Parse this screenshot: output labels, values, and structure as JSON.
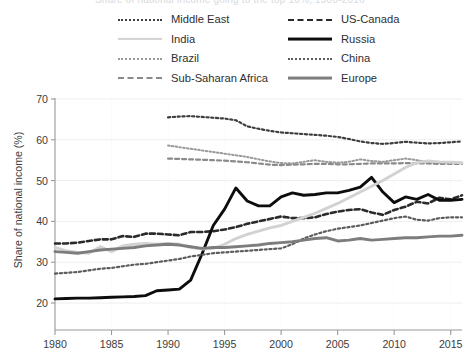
{
  "title_clipped": "Share of national income going to the top 10%, 1980-2016",
  "legend": {
    "columns": [
      {
        "items": [
          {
            "label": "Middle East",
            "key": "middle-east",
            "style": "dotted",
            "color": "#3d3d3d"
          },
          {
            "label": "India",
            "key": "india",
            "style": "solid",
            "color": "#d2d2d2"
          },
          {
            "label": "Brazil",
            "key": "brazil",
            "style": "dotted-fine",
            "color": "#9a9a9a"
          },
          {
            "label": "Sub-Saharan Africa",
            "key": "sub-saharan-africa",
            "style": "dashed",
            "color": "#8a8a8a"
          }
        ]
      },
      {
        "items": [
          {
            "label": "US-Canada",
            "key": "us-canada",
            "style": "dashed-bold",
            "color": "#2a2a2a"
          },
          {
            "label": "Russia",
            "key": "russia",
            "style": "solid-bold",
            "color": "#0d0d0d"
          },
          {
            "label": "China",
            "key": "china",
            "style": "dotted",
            "color": "#5c5c5c"
          },
          {
            "label": "Europe",
            "key": "europe",
            "style": "solid-bold",
            "color": "#7d7d7d"
          }
        ]
      }
    ]
  },
  "chart_data": {
    "type": "line",
    "title": "",
    "xlabel": "",
    "ylabel": "Share of national income (%)",
    "xlim": [
      1980,
      2016
    ],
    "ylim": [
      18,
      70
    ],
    "xticks": [
      1980,
      1985,
      1990,
      1995,
      2000,
      2005,
      2010,
      2015
    ],
    "yticks": [
      20,
      30,
      40,
      50,
      60,
      70
    ],
    "grid": true,
    "legend_position": "top",
    "series": [
      {
        "name": "Middle East",
        "color": "#3d3d3d",
        "style": "dotted",
        "width": 2.2,
        "x": [
          1990,
          1991,
          1992,
          1993,
          1994,
          1995,
          1996,
          1997,
          1998,
          1999,
          2000,
          2001,
          2002,
          2003,
          2004,
          2005,
          2006,
          2007,
          2008,
          2009,
          2010,
          2011,
          2012,
          2013,
          2014,
          2015,
          2016
        ],
        "y": [
          65.5,
          65.7,
          65.8,
          65.6,
          65.4,
          65.2,
          64.8,
          63.3,
          62.7,
          62.2,
          61.8,
          61.6,
          61.4,
          61.2,
          61.0,
          60.7,
          60.2,
          59.6,
          59.2,
          59.0,
          59.2,
          59.5,
          59.3,
          59.1,
          59.2,
          59.4,
          59.6
        ]
      },
      {
        "name": "Brazil",
        "color": "#9a9a9a",
        "style": "dotted-fine",
        "width": 2.0,
        "x": [
          1990,
          1991,
          1992,
          1993,
          1994,
          1995,
          1996,
          1997,
          1998,
          1999,
          2000,
          2001,
          2002,
          2003,
          2004,
          2005,
          2006,
          2007,
          2008,
          2009,
          2010,
          2011,
          2012,
          2013,
          2014,
          2015,
          2016
        ],
        "y": [
          58.6,
          58.2,
          57.8,
          57.4,
          57.0,
          56.6,
          56.2,
          55.8,
          55.2,
          54.7,
          54.3,
          54.2,
          54.6,
          55.0,
          54.6,
          54.4,
          54.6,
          55.2,
          54.8,
          54.6,
          55.0,
          55.4,
          55.0,
          54.6,
          54.4,
          54.3,
          54.3
        ]
      },
      {
        "name": "Sub-Saharan Africa",
        "color": "#8a8a8a",
        "style": "dashed",
        "width": 2.2,
        "x": [
          1990,
          1991,
          1992,
          1993,
          1994,
          1995,
          1996,
          1997,
          1998,
          1999,
          2000,
          2001,
          2002,
          2003,
          2004,
          2005,
          2006,
          2007,
          2008,
          2009,
          2010,
          2011,
          2012,
          2013,
          2014,
          2015,
          2016
        ],
        "y": [
          55.4,
          55.3,
          55.2,
          55.1,
          55.0,
          54.9,
          54.7,
          54.5,
          54.2,
          53.9,
          53.8,
          53.9,
          54.0,
          54.1,
          54.1,
          54.0,
          54.0,
          54.1,
          54.2,
          54.2,
          54.2,
          54.3,
          54.2,
          54.2,
          54.1,
          54.1,
          54.1
        ]
      },
      {
        "name": "US-Canada",
        "color": "#2a2a2a",
        "style": "dashed-bold",
        "width": 2.6,
        "x": [
          1980,
          1981,
          1982,
          1983,
          1984,
          1985,
          1986,
          1987,
          1988,
          1989,
          1990,
          1991,
          1992,
          1993,
          1994,
          1995,
          1996,
          1997,
          1998,
          1999,
          2000,
          2001,
          2002,
          2003,
          2004,
          2005,
          2006,
          2007,
          2008,
          2009,
          2010,
          2011,
          2012,
          2013,
          2014,
          2015,
          2016
        ],
        "y": [
          34.6,
          34.6,
          34.8,
          35.2,
          35.6,
          35.6,
          36.4,
          36.2,
          37.0,
          37.0,
          36.8,
          36.6,
          37.4,
          37.4,
          37.6,
          38.0,
          38.6,
          39.4,
          40.0,
          40.6,
          41.2,
          40.8,
          40.8,
          41.0,
          41.8,
          42.4,
          42.8,
          43.0,
          42.2,
          41.6,
          42.8,
          43.6,
          44.8,
          44.4,
          45.8,
          45.4,
          46.4
        ]
      },
      {
        "name": "Russia",
        "color": "#0d0d0d",
        "style": "solid-bold",
        "width": 2.9,
        "x": [
          1980,
          1981,
          1982,
          1983,
          1984,
          1985,
          1986,
          1987,
          1988,
          1989,
          1990,
          1991,
          1992,
          1993,
          1994,
          1995,
          1996,
          1997,
          1998,
          1999,
          2000,
          2001,
          2002,
          2003,
          2004,
          2005,
          2006,
          2007,
          2008,
          2009,
          2010,
          2011,
          2012,
          2013,
          2014,
          2015,
          2016
        ],
        "y": [
          21.0,
          21.1,
          21.2,
          21.2,
          21.3,
          21.4,
          21.5,
          21.6,
          21.8,
          23.0,
          23.2,
          23.4,
          25.6,
          32.0,
          39.0,
          43.0,
          48.2,
          45.0,
          43.8,
          43.8,
          46.0,
          47.0,
          46.4,
          46.6,
          47.0,
          47.0,
          47.6,
          48.4,
          50.8,
          47.2,
          44.6,
          46.0,
          45.4,
          46.6,
          45.2,
          45.2,
          45.4
        ]
      },
      {
        "name": "India",
        "color": "#d2d2d2",
        "style": "solid",
        "width": 2.9,
        "x": [
          1980,
          1981,
          1982,
          1983,
          1984,
          1985,
          1986,
          1987,
          1988,
          1989,
          1990,
          1991,
          1992,
          1993,
          1994,
          1995,
          1996,
          1997,
          1998,
          1999,
          2000,
          2001,
          2002,
          2003,
          2004,
          2005,
          2006,
          2007,
          2008,
          2009,
          2010,
          2011,
          2012,
          2013,
          2014,
          2015,
          2016
        ],
        "y": [
          33.6,
          32.8,
          32.4,
          32.2,
          33.8,
          32.6,
          34.0,
          34.4,
          34.6,
          34.4,
          34.6,
          34.4,
          33.6,
          33.2,
          33.4,
          34.4,
          35.8,
          36.8,
          37.6,
          38.4,
          39.0,
          40.0,
          41.0,
          42.0,
          43.2,
          44.4,
          45.8,
          47.2,
          48.6,
          50.0,
          51.6,
          53.2,
          54.4,
          54.8,
          54.6,
          54.5,
          54.4
        ]
      },
      {
        "name": "China",
        "color": "#5c5c5c",
        "style": "dotted",
        "width": 2.2,
        "x": [
          1980,
          1981,
          1982,
          1983,
          1984,
          1985,
          1986,
          1987,
          1988,
          1989,
          1990,
          1991,
          1992,
          1993,
          1994,
          1995,
          1996,
          1997,
          1998,
          1999,
          2000,
          2001,
          2002,
          2003,
          2004,
          2005,
          2006,
          2007,
          2008,
          2009,
          2010,
          2011,
          2012,
          2013,
          2014,
          2015,
          2016
        ],
        "y": [
          27.2,
          27.4,
          27.6,
          28.0,
          28.4,
          28.6,
          29.0,
          29.4,
          29.6,
          30.0,
          30.4,
          30.8,
          31.4,
          31.8,
          32.2,
          32.4,
          32.6,
          32.8,
          33.0,
          33.2,
          33.4,
          34.4,
          35.8,
          36.8,
          37.6,
          38.2,
          38.6,
          39.0,
          39.6,
          40.2,
          40.8,
          41.2,
          40.4,
          40.2,
          40.8,
          41.0,
          41.0
        ]
      },
      {
        "name": "Europe",
        "color": "#7d7d7d",
        "style": "solid-bold",
        "width": 2.9,
        "x": [
          1980,
          1981,
          1982,
          1983,
          1984,
          1985,
          1986,
          1987,
          1988,
          1989,
          1990,
          1991,
          1992,
          1993,
          1994,
          1995,
          1996,
          1997,
          1998,
          1999,
          2000,
          2001,
          2002,
          2003,
          2004,
          2005,
          2006,
          2007,
          2008,
          2009,
          2010,
          2011,
          2012,
          2013,
          2014,
          2015,
          2016
        ],
        "y": [
          32.6,
          32.4,
          32.2,
          32.6,
          33.0,
          33.2,
          33.4,
          33.6,
          34.0,
          34.2,
          34.4,
          34.2,
          33.8,
          33.4,
          33.6,
          33.6,
          33.8,
          34.0,
          34.2,
          34.6,
          34.8,
          35.0,
          35.4,
          35.8,
          36.0,
          35.2,
          35.4,
          35.8,
          35.4,
          35.6,
          35.8,
          36.0,
          36.0,
          36.2,
          36.4,
          36.4,
          36.6
        ]
      }
    ]
  }
}
